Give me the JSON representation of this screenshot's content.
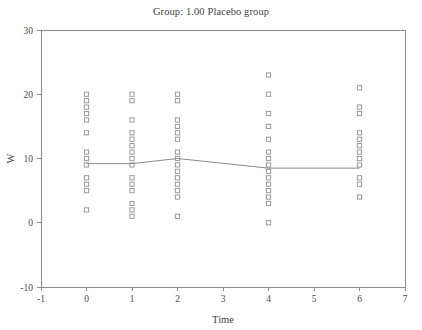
{
  "chart_data": {
    "type": "scatter",
    "title": "Group: 1.00 Placebo group",
    "xlabel": "Time",
    "ylabel": "W",
    "xlim": [
      -1,
      7
    ],
    "ylim": [
      -10,
      30
    ],
    "xticks": [
      -1,
      0,
      1,
      2,
      3,
      4,
      5,
      6,
      7
    ],
    "xticklabels": [
      "-1",
      "0",
      "1",
      "2",
      "3",
      "4",
      "5",
      "6",
      "7"
    ],
    "yticks": [
      -10,
      0,
      10,
      20,
      30
    ],
    "yticklabels": [
      "-10",
      "0",
      "10",
      "20",
      "30"
    ],
    "grid": false,
    "legend": null,
    "marker": "open-square",
    "marker_color": "#9a9a9a",
    "line_color": "#8a8a8a",
    "series": [
      {
        "name": "observations",
        "x": [
          0,
          0,
          0,
          0,
          0,
          0,
          0,
          0,
          0,
          0,
          0,
          0,
          0,
          1,
          1,
          1,
          1,
          1,
          1,
          1,
          1,
          1,
          1,
          1,
          1,
          1,
          1,
          1,
          2,
          2,
          2,
          2,
          2,
          2,
          2,
          2,
          2,
          2,
          2,
          2,
          2,
          2,
          2,
          4,
          4,
          4,
          4,
          4,
          4,
          4,
          4,
          4,
          4,
          4,
          4,
          4,
          4,
          4,
          6,
          6,
          6,
          6,
          6,
          6,
          6,
          6,
          6,
          6,
          6,
          6
        ],
        "y": [
          20,
          19,
          18,
          17,
          16,
          14,
          11,
          10,
          9,
          7,
          6,
          5,
          2,
          20,
          19,
          16,
          14,
          13,
          12,
          11,
          10,
          9,
          7,
          6,
          5,
          3,
          2,
          1,
          20,
          19,
          16,
          15,
          14,
          13,
          11,
          10,
          9,
          8,
          7,
          6,
          5,
          4,
          1,
          23,
          20,
          17,
          15,
          13,
          11,
          10,
          9,
          8,
          7,
          6,
          5,
          4,
          3,
          0,
          21,
          18,
          17,
          14,
          13,
          12,
          11,
          10,
          9,
          7,
          6,
          4
        ]
      },
      {
        "name": "mean-profile",
        "x": [
          0,
          1,
          2,
          4,
          6
        ],
        "y": [
          9.2,
          9.2,
          10.0,
          8.5,
          8.5
        ]
      }
    ]
  },
  "plot_geometry": {
    "left": 41,
    "right": 405,
    "top": 30,
    "bottom": 287
  }
}
